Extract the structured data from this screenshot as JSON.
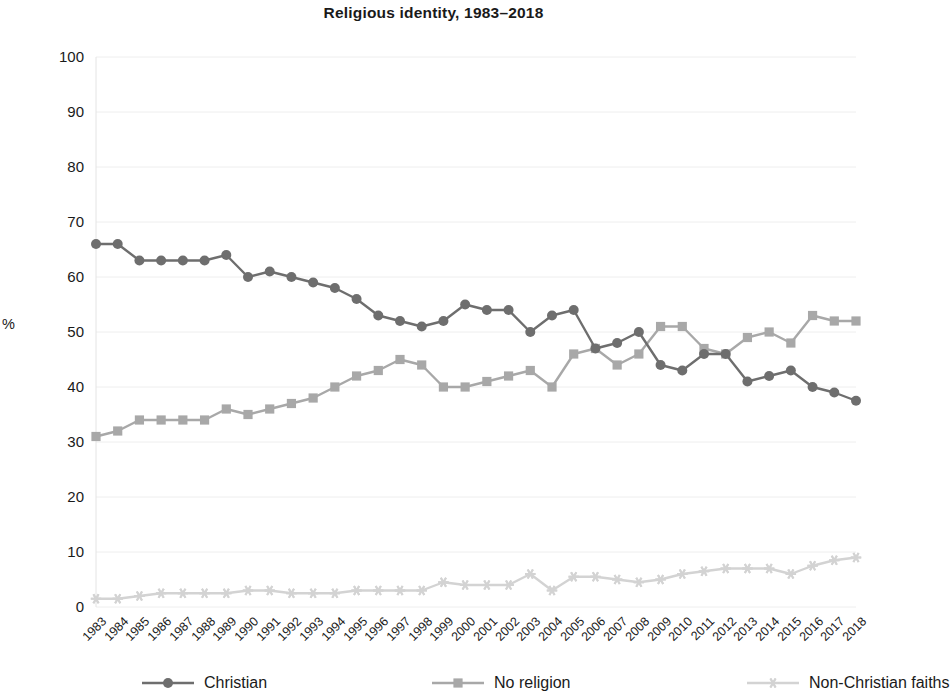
{
  "chart_data": {
    "type": "line",
    "title": "Religious identity, 1983–2018",
    "xlabel": "",
    "ylabel": "%",
    "ylim": [
      0,
      100
    ],
    "ytick_step": 10,
    "grid": true,
    "legend_position": "bottom",
    "categories": [
      "1983",
      "1984",
      "1985",
      "1986",
      "1987",
      "1988",
      "1989",
      "1990",
      "1991",
      "1992",
      "1993",
      "1994",
      "1995",
      "1996",
      "1997",
      "1998",
      "1999",
      "2000",
      "2001",
      "2002",
      "2003",
      "2004",
      "2005",
      "2006",
      "2007",
      "2008",
      "2009",
      "2010",
      "2011",
      "2012",
      "2013",
      "2014",
      "2015",
      "2016",
      "2017",
      "2018"
    ],
    "yticks": [
      "0",
      "10",
      "20",
      "30",
      "40",
      "50",
      "60",
      "70",
      "80",
      "90",
      "100"
    ],
    "series": [
      {
        "name": "Christian",
        "color": "#6e6e6e",
        "marker": "circle",
        "values": [
          66,
          66,
          63,
          63,
          63,
          63,
          64,
          60,
          61,
          60,
          59,
          58,
          56,
          53,
          52,
          51,
          52,
          55,
          54,
          54,
          50,
          53,
          54,
          47,
          48,
          50,
          44,
          43,
          46,
          46,
          41,
          42,
          43,
          40,
          39,
          37.5
        ]
      },
      {
        "name": "No religion",
        "color": "#a8a8a8",
        "marker": "square",
        "values": [
          31,
          32,
          34,
          34,
          34,
          34,
          36,
          35,
          36,
          37,
          38,
          40,
          42,
          43,
          45,
          44,
          40,
          40,
          41,
          42,
          43,
          40,
          46,
          47,
          44,
          46,
          51,
          51,
          47,
          46,
          49,
          50,
          48,
          53,
          52,
          52
        ]
      },
      {
        "name": "Non-Christian faiths",
        "color": "#d3d3d3",
        "marker": "star",
        "values": [
          1.5,
          1.5,
          2,
          2.5,
          2.5,
          2.5,
          2.5,
          3,
          3,
          2.5,
          2.5,
          2.5,
          3,
          3,
          3,
          3,
          4.5,
          4,
          4,
          4,
          6,
          3,
          5.5,
          5.5,
          5,
          4.5,
          5,
          6,
          6.5,
          7,
          7,
          7,
          6,
          7.5,
          8.5,
          9
        ]
      }
    ]
  },
  "legend": {
    "items": [
      {
        "label": "Christian",
        "icon": "circle-marker-icon"
      },
      {
        "label": "No religion",
        "icon": "square-marker-icon"
      },
      {
        "label": "Non-Christian faiths",
        "icon": "star-marker-icon"
      }
    ]
  },
  "colors": {
    "christian": "#6e6e6e",
    "no_religion": "#a8a8a8",
    "non_christian": "#d3d3d3",
    "grid": "#eeeeee",
    "text": "#1a1a1a"
  }
}
